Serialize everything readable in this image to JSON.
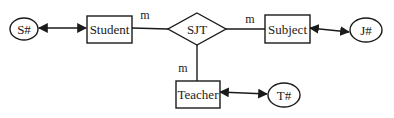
{
  "diagram": {
    "type": "ER diagram",
    "relationship": {
      "id": "SJT",
      "label": "SJT"
    },
    "entities": [
      {
        "id": "student",
        "label": "Student"
      },
      {
        "id": "subject",
        "label": "Subject"
      },
      {
        "id": "teacher",
        "label": "Teacher"
      }
    ],
    "attributes": [
      {
        "id": "s_key",
        "label": "S#",
        "entity": "student"
      },
      {
        "id": "j_key",
        "label": "J#",
        "entity": "subject"
      },
      {
        "id": "t_key",
        "label": "T#",
        "entity": "teacher"
      }
    ],
    "cardinalities": {
      "student_sjt": "m",
      "sjt_subject": "m",
      "sjt_teacher": "m"
    },
    "edges": [
      {
        "from": "S#",
        "to": "Student",
        "style": "double-arrow"
      },
      {
        "from": "Student",
        "to": "SJT",
        "style": "line",
        "cardinality": "m"
      },
      {
        "from": "SJT",
        "to": "Subject",
        "style": "line",
        "cardinality": "m"
      },
      {
        "from": "Subject",
        "to": "J#",
        "style": "double-arrow"
      },
      {
        "from": "SJT",
        "to": "Teacher",
        "style": "line",
        "cardinality": "m"
      },
      {
        "from": "Teacher",
        "to": "T#",
        "style": "double-arrow"
      }
    ]
  }
}
